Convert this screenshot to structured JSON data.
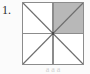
{
  "figure": {
    "item_number": "1.",
    "caption_fragment": "a a a",
    "background_color": "#fbfbfb",
    "diagram": {
      "name": "square-divided-into-eight-triangles",
      "outline_color": "#8c8c8c",
      "grid_line_color": "#8c8c8c",
      "diagonal_line_color": "#6e6e6e",
      "shaded_fill_color": "#b8b8b8",
      "unshaded_fill_color": "#ffffff",
      "regions": [
        {
          "label": "top-left-quadrant",
          "shaded": false
        },
        {
          "label": "top-right-quadrant",
          "shaded": true
        },
        {
          "label": "bottom-left-quadrant",
          "shaded": false
        },
        {
          "label": "bottom-right-quadrant",
          "shaded": false
        }
      ],
      "shaded_fraction": "1/4",
      "total_triangles": 8,
      "shaded_triangles": 2
    }
  }
}
